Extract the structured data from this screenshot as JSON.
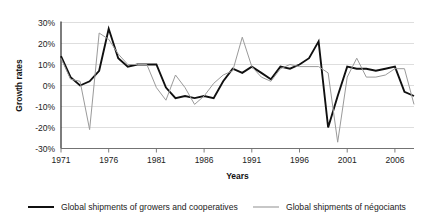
{
  "chart_data": {
    "type": "line",
    "title": "",
    "xlabel": "Years",
    "ylabel": "Growth rates",
    "grid": true,
    "legend_position": "bottom",
    "xlim": [
      1971,
      2008
    ],
    "ylim": [
      -30,
      30
    ],
    "ytick_labels": [
      "30%",
      "20%",
      "10%",
      "0%",
      "-10%",
      "-20%",
      "-30%"
    ],
    "ytick_values": [
      30,
      20,
      10,
      0,
      -10,
      -20,
      -30
    ],
    "xtick_labels": [
      "1971",
      "1976",
      "1981",
      "1986",
      "1991",
      "1996",
      "2001",
      "2006"
    ],
    "xtick_values": [
      1971,
      1976,
      1981,
      1986,
      1991,
      1996,
      2001,
      2006
    ],
    "x": [
      1971,
      1972,
      1973,
      1974,
      1975,
      1976,
      1977,
      1978,
      1979,
      1980,
      1981,
      1982,
      1983,
      1984,
      1985,
      1986,
      1987,
      1988,
      1989,
      1990,
      1991,
      1992,
      1993,
      1994,
      1995,
      1996,
      1997,
      1998,
      1999,
      2000,
      2001,
      2002,
      2003,
      2004,
      2005,
      2006,
      2007,
      2008
    ],
    "series": [
      {
        "name": "Global shipments of growers and cooperatives",
        "color": "#101010",
        "width": 1.9,
        "values": [
          14,
          4,
          0,
          2,
          7,
          27,
          13,
          9,
          10,
          10,
          10,
          -1,
          -6,
          -5,
          -6,
          -5,
          -6,
          2,
          8,
          6,
          9,
          6,
          3,
          9,
          8,
          10,
          13,
          21,
          -20,
          -5,
          9,
          8,
          8,
          7,
          8,
          9,
          -3,
          -5
        ]
      },
      {
        "name": "Global shipments of négociants",
        "color": "#9a9a9a",
        "width": 1.0,
        "values": [
          13,
          3,
          2,
          -21,
          25,
          22,
          15,
          10,
          10,
          10,
          -1,
          -7,
          5,
          -1,
          -9,
          -5,
          1,
          5,
          7,
          23,
          9,
          4,
          2,
          8,
          10,
          9,
          9,
          9,
          6,
          -27,
          4,
          13,
          4,
          4,
          5,
          8,
          8,
          -9
        ]
      }
    ]
  },
  "legend": {
    "items": [
      {
        "label": "Global shipments of growers and cooperatives",
        "color": "#101010",
        "width": 2.0
      },
      {
        "label": "Global shipments of négociants",
        "color": "#9a9a9a",
        "width": 1.1
      }
    ]
  }
}
